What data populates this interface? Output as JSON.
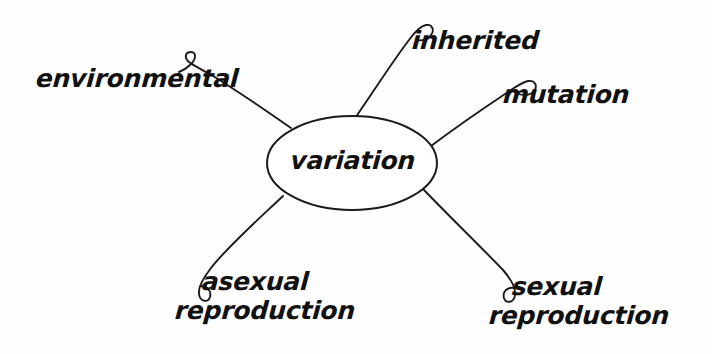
{
  "diagram": {
    "type": "concept-map",
    "title": "variation",
    "background_color": "#fefefe",
    "ink_color": "#1a1a1a",
    "center_node": {
      "label": "variation",
      "shape": "ellipse",
      "cx": 352,
      "cy": 163,
      "rx": 85,
      "ry": 47
    },
    "branches": [
      {
        "id": "environmental",
        "label": "environmental",
        "label_lines": [
          "environmental"
        ],
        "position": "upper-left",
        "hook": "curl-left"
      },
      {
        "id": "inherited",
        "label": "inherited",
        "label_lines": [
          "inherited"
        ],
        "position": "top",
        "hook": "curl-left"
      },
      {
        "id": "mutation",
        "label": "mutation",
        "label_lines": [
          "mutation"
        ],
        "position": "upper-right",
        "hook": "curl-left"
      },
      {
        "id": "asexual-reproduction",
        "label": "asexual reproduction",
        "label_lines": [
          "asexual",
          "reproduction"
        ],
        "position": "lower-left",
        "hook": "curl-left"
      },
      {
        "id": "sexual-reproduction",
        "label": "sexual reproduction",
        "label_lines": [
          "sexual",
          "reproduction"
        ],
        "position": "lower-right",
        "hook": "curl-left"
      }
    ]
  }
}
